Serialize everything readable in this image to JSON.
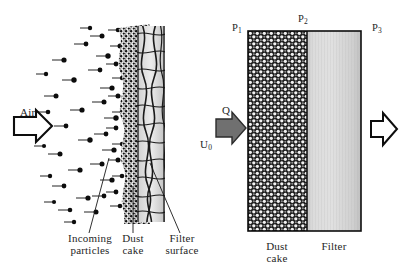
{
  "figure": {
    "background_color": "#ffffff",
    "ink_color": "#1a1a1a"
  },
  "left_panel": {
    "name": "microscopic-view",
    "inlet_label": "Air",
    "inlet_arrow": "hollow-right-arrow",
    "callouts": [
      {
        "id": "incoming-particles",
        "line1": "Incoming",
        "line2": "particles"
      },
      {
        "id": "dust-cake",
        "line1": "Dust",
        "line2": "cake"
      },
      {
        "id": "filter-surface",
        "line1": "Filter",
        "line2": "surface"
      }
    ],
    "particle_color": "#000000",
    "weave_fill": "#d9d9d9",
    "weave_stroke": "#1a1a1a"
  },
  "right_panel": {
    "name": "pressure-drop-model",
    "flow_label": "Q",
    "velocity_label": "U",
    "velocity_sub": "0",
    "inlet_arrow": "solid-gray-right-arrow",
    "outlet_arrow": "hollow-right-arrow",
    "inlet_arrow_color": "#6e6e6e",
    "pressures": [
      {
        "id": "p1",
        "symbol": "P",
        "sub": "1"
      },
      {
        "id": "p2",
        "symbol": "P",
        "sub": "2"
      },
      {
        "id": "p3",
        "symbol": "P",
        "sub": "3"
      }
    ],
    "layers": [
      {
        "id": "dust-cake",
        "line1": "Dust",
        "line2": "cake",
        "fill": "#2b2b2b",
        "pattern": "checkered-spheres"
      },
      {
        "id": "filter",
        "line1": "Filter",
        "line2": "",
        "fill": "#d2d2d2",
        "pattern": "vertical-fiber-gradient"
      }
    ]
  }
}
